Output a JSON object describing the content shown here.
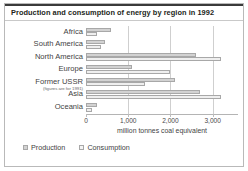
{
  "chart_data": {
    "type": "bar",
    "orientation": "horizontal",
    "title": "Production and consumption of energy by region in 1992",
    "xlabel": "million tonnes coal equivalent",
    "ylabel": "",
    "xlim": [
      0,
      3600
    ],
    "xticks": [
      0,
      1000,
      2000,
      3000
    ],
    "xticklabels": [
      "0",
      "1,000",
      "2,000",
      "3,000"
    ],
    "grid": true,
    "legend_position": "bottom-left",
    "categories": [
      "Africa",
      "South America",
      "North America",
      "Europe",
      "Former USSR",
      "Asia",
      "Oceania"
    ],
    "category_notes": {
      "Former USSR": "(figures are for 1991)"
    },
    "series": [
      {
        "name": "Production",
        "color": "#d2d2d2",
        "values": [
          600,
          450,
          2600,
          1100,
          2100,
          2700,
          250
        ]
      },
      {
        "name": "Consumption",
        "color": "#efefef",
        "values": [
          250,
          350,
          3200,
          2000,
          1400,
          3200,
          150
        ]
      }
    ]
  },
  "legend": {
    "items": [
      {
        "label": "Production",
        "swatch": "production"
      },
      {
        "label": "Consumption",
        "swatch": "consumption"
      }
    ]
  }
}
